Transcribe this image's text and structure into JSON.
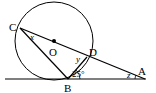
{
  "diagram": {
    "type": "geometry",
    "points": {
      "C": {
        "label": "C",
        "x": 20,
        "y": 28
      },
      "O": {
        "label": "O",
        "x": 54,
        "y": 41
      },
      "D": {
        "label": "D",
        "x": 87,
        "y": 57
      },
      "B": {
        "label": "B",
        "x": 68,
        "y": 79
      },
      "A": {
        "label": "A",
        "x": 145,
        "y": 79
      }
    },
    "circle": {
      "center": "O",
      "cx": 54,
      "cy": 41,
      "r": 39
    },
    "angles": {
      "x": {
        "label": "x",
        "at": "C"
      },
      "y": {
        "label": "y",
        "at": "D"
      },
      "z": {
        "label": "z",
        "at": "A"
      },
      "given": {
        "label": "25°",
        "at": "B",
        "between": "BD and BA"
      }
    },
    "colors": {
      "stroke": "#000000",
      "background": "#ffffff"
    }
  }
}
